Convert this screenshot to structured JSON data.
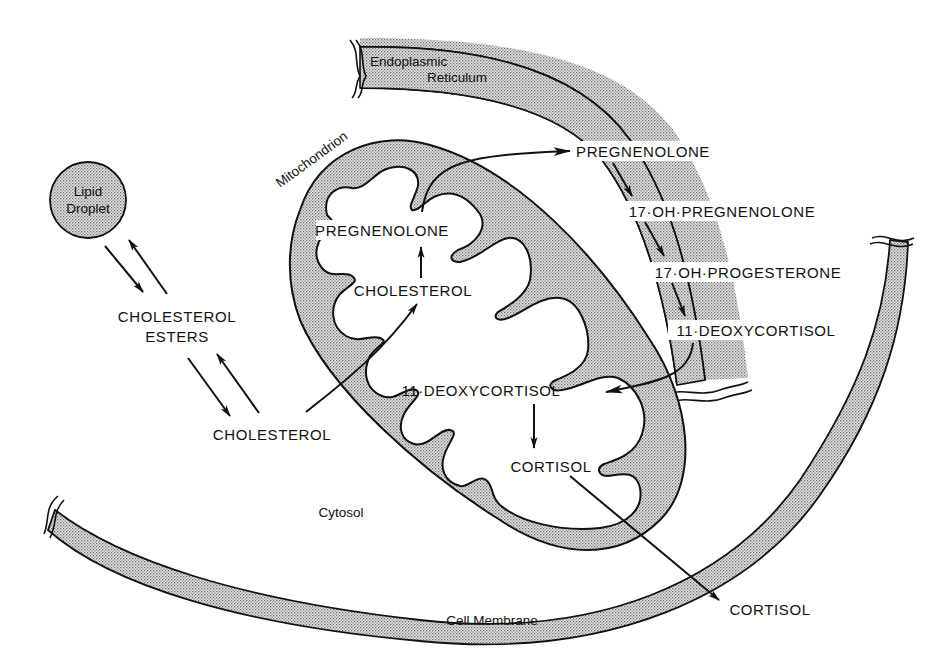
{
  "diagram": {
    "compartments": {
      "lipid_droplet": {
        "line1": "Lipid",
        "line2": "Droplet"
      },
      "endoplasmic_reticulum": {
        "line1": "Endoplasmic",
        "line2": "Reticulum"
      },
      "mitochondrion": "Mitochondrion",
      "cytosol": "Cytosol",
      "cell_membrane": "Cell Membrane"
    },
    "cytosol_species": {
      "cholesterol_esters_line1": "CHOLESTEROL",
      "cholesterol_esters_line2": "ESTERS",
      "cholesterol": "CHOLESTEROL"
    },
    "mitochondrion_species": {
      "pregnenolone": "PREGNENOLONE",
      "cholesterol": "CHOLESTEROL",
      "deoxycortisol": "11·DEOXYCORTISOL",
      "cortisol": "CORTISOL"
    },
    "er_species": {
      "pregnenolone": "PREGNENOLONE",
      "oh_pregnenolone": "17·OH·PREGNENOLONE",
      "oh_progesterone": "17·OH·PROGESTERONE",
      "deoxycortisol": "11·DEOXYCORTISOL"
    },
    "extracellular_species": {
      "cortisol": "CORTISOL"
    },
    "pathway": [
      "Lipid Droplet ⇄ CHOLESTEROL ESTERS",
      "CHOLESTEROL ESTERS ⇄ CHOLESTEROL",
      "CHOLESTEROL (cytosol) → CHOLESTEROL (mitochondrion)",
      "CHOLESTEROL → PREGNENOLONE",
      "PREGNENOLONE (mitochondrion) → PREGNENOLONE (ER)",
      "PREGNENOLONE → 17·OH·PREGNENOLONE",
      "17·OH·PREGNENOLONE → 17·OH·PROGESTERONE",
      "17·OH·PROGESTERONE → 11·DEOXYCORTISOL",
      "11·DEOXYCORTISOL (ER) → 11·DEOXYCORTISOL (mitochondrion)",
      "11·DEOXYCORTISOL → CORTISOL",
      "CORTISOL (mitochondrion) → CORTISOL (extracellular)"
    ],
    "colors": {
      "ink": "#111111",
      "background": "#ffffff",
      "stipple": "#8a8a8a"
    }
  }
}
